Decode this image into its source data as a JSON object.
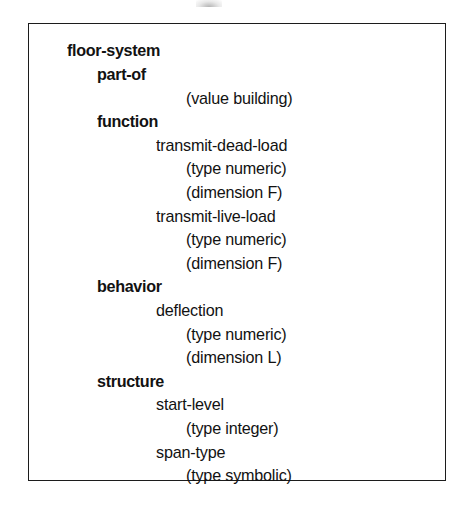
{
  "figure": {
    "root": "floor-system",
    "border_color": "#1c1c1c",
    "text_color": "#121212",
    "background_color": "#ffffff"
  },
  "lines": [
    {
      "text": "floor-system",
      "level": 1,
      "bold": true,
      "top": 14
    },
    {
      "text": "part-of",
      "level": 2,
      "bold": true,
      "top": 43
    },
    {
      "text": "(value building)",
      "level": 4,
      "bold": false,
      "top": 72
    },
    {
      "text": "function",
      "level": 2,
      "bold": true,
      "top": 101
    },
    {
      "text": "transmit-dead-load",
      "level": 3,
      "bold": false,
      "top": 130
    },
    {
      "text": "(type numeric)",
      "level": 4,
      "bold": false,
      "top": 159
    },
    {
      "text": "(dimension F)",
      "level": 4,
      "bold": false,
      "top": 188
    },
    {
      "text": "transmit-live-load",
      "level": 3,
      "bold": false,
      "top": 217
    },
    {
      "text": "(type numeric)",
      "level": 4,
      "bold": false,
      "top": 246
    },
    {
      "text": "(dimension F)",
      "level": 4,
      "bold": false,
      "top": 275
    },
    {
      "text": "behavior",
      "level": 2,
      "bold": true,
      "top": 304
    },
    {
      "text": "deflection",
      "level": 3,
      "bold": false,
      "top": 333
    },
    {
      "text": "(type numeric)",
      "level": 4,
      "bold": false,
      "top": 362
    },
    {
      "text": "(dimension L)",
      "level": 4,
      "bold": false,
      "top": 391
    },
    {
      "text": "structure",
      "level": 2,
      "bold": true,
      "top": 420
    },
    {
      "text": "start-level",
      "level": 3,
      "bold": false,
      "top": 449
    },
    {
      "text": "(type integer)",
      "level": 4,
      "bold": false,
      "top": 478
    },
    {
      "text": "span-type",
      "level": 3,
      "bold": false,
      "top": 507
    },
    {
      "text": "(type symbolic)",
      "level": 4,
      "bold": false,
      "top": 536
    }
  ]
}
